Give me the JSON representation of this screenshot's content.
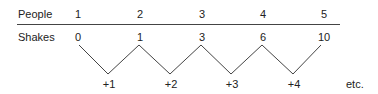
{
  "table": {
    "row_labels": {
      "people": "People",
      "shakes": "Shakes"
    },
    "people": [
      "1",
      "2",
      "3",
      "4",
      "5"
    ],
    "shakes": [
      "0",
      "1",
      "3",
      "6",
      "10"
    ]
  },
  "differences": [
    "+1",
    "+2",
    "+3",
    "+4"
  ],
  "continuation": "etc.",
  "colors": {
    "text": "#222222",
    "lines": "#444444"
  }
}
